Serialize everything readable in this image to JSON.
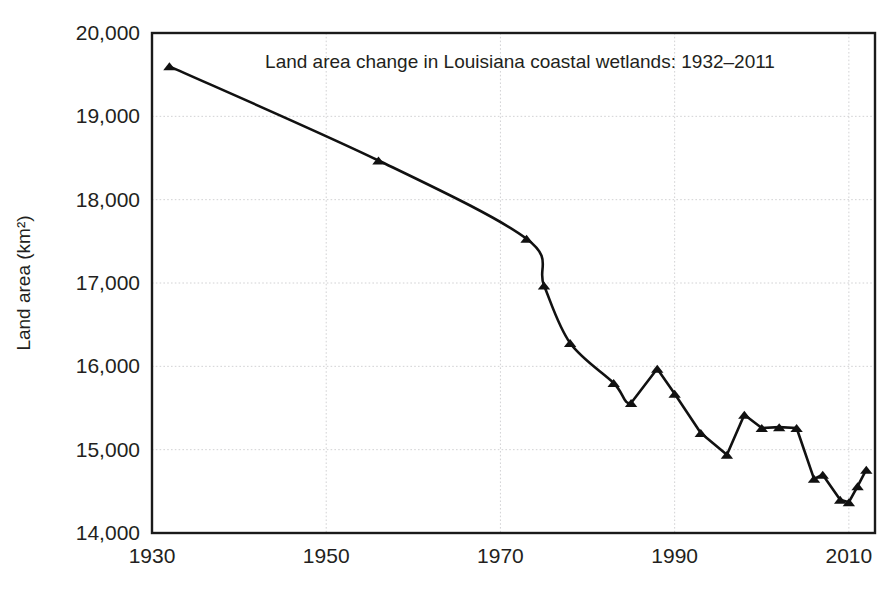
{
  "chart_data": {
    "type": "line",
    "title": "Land area change in Louisiana coastal wetlands: 1932–2011",
    "xlabel": "",
    "ylabel": "Land area (km²)",
    "xlim": [
      1930,
      2013
    ],
    "ylim": [
      14000,
      20000
    ],
    "xticks": [
      "1930",
      "1950",
      "1970",
      "1990",
      "2010"
    ],
    "xtick_values": [
      1930,
      1950,
      1970,
      1990,
      2010
    ],
    "yticks": [
      "14,000",
      "15,000",
      "16,000",
      "17,000",
      "18,000",
      "19,000",
      "20,000"
    ],
    "ytick_values": [
      14000,
      15000,
      16000,
      17000,
      18000,
      19000,
      20000
    ],
    "grid": true,
    "legend": null,
    "line_color": "#111111",
    "marker": "triangle",
    "series": [
      {
        "name": "Louisiana coastal wetland land area",
        "x": [
          1932,
          1956,
          1973,
          1975,
          1978,
          1983,
          1985,
          1988,
          1990,
          1993,
          1996,
          1998,
          2000,
          2002,
          2004,
          2006,
          2007,
          2009,
          2010,
          2011,
          2012
        ],
        "values": [
          19600,
          18470,
          17530,
          16970,
          16280,
          15800,
          15560,
          15970,
          15670,
          15200,
          14940,
          15420,
          15260,
          15270,
          15260,
          14650,
          14700,
          14400,
          14370,
          14560,
          14760
        ]
      }
    ]
  },
  "figure": {
    "background_color": "#ffffff",
    "grid_color": "#d2d2d4",
    "frame_color": "#1a1a1a"
  }
}
